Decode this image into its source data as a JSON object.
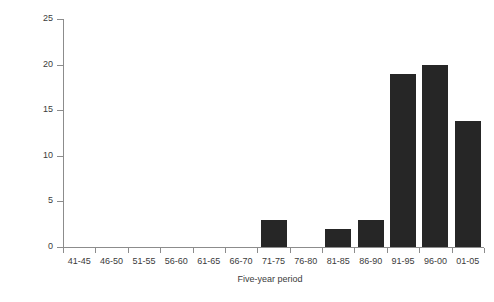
{
  "chart_data": {
    "type": "bar",
    "title": "",
    "xlabel": "Five-year period",
    "ylabel": "Number of birds",
    "categories": [
      "41-45",
      "46-50",
      "51-55",
      "56-60",
      "61-65",
      "66-70",
      "71-75",
      "76-80",
      "81-85",
      "86-90",
      "91-95",
      "96-00",
      "01-05"
    ],
    "values": [
      0,
      0,
      0,
      0,
      0,
      0,
      3,
      0,
      2,
      3,
      19,
      20,
      13.8
    ],
    "yticks": [
      0,
      5,
      10,
      15,
      20,
      25
    ],
    "ylim": [
      0,
      25
    ],
    "grid": false,
    "legend": null,
    "bar_color": "#262626",
    "axis_color": "#8c8c8c"
  }
}
